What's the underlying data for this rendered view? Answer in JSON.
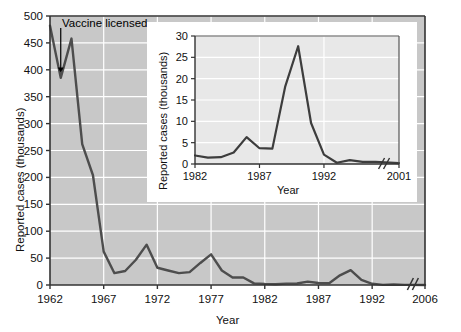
{
  "figure": {
    "background": "#ffffff",
    "plot_background": "#c8c8c8",
    "inset_plot_background": "#e8e8e8",
    "gridline_color": "#ffffff",
    "line_color": "#4d4d4d",
    "axis_color": "#333333"
  },
  "chart_data": [
    {
      "id": "main",
      "type": "line",
      "title": "",
      "xlabel": "Year",
      "ylabel": "Reported cases (thousands)",
      "xlim": [
        1962,
        2006
      ],
      "ylim": [
        0,
        500
      ],
      "xticks": [
        1962,
        1967,
        1972,
        1977,
        1982,
        1987,
        1992,
        2006
      ],
      "xticklabels": [
        "1962",
        "1967",
        "1972",
        "1977",
        "1982",
        "1987",
        "1992",
        "2006"
      ],
      "yticks": [
        0,
        50,
        100,
        150,
        200,
        250,
        300,
        350,
        400,
        450,
        500
      ],
      "yticklabels": [
        "0",
        "50",
        "100",
        "150",
        "200",
        "250",
        "300",
        "350",
        "400",
        "450",
        "500"
      ],
      "grid": true,
      "axis_break": {
        "axis": "x",
        "between": [
          1995,
          2006
        ],
        "symbol": "//"
      },
      "annotations": [
        {
          "text": "Vaccine licensed",
          "x": 1963,
          "y": 395,
          "arrow": true
        }
      ],
      "x": [
        1962,
        1963,
        1964,
        1965,
        1966,
        1967,
        1968,
        1969,
        1970,
        1971,
        1972,
        1973,
        1974,
        1975,
        1976,
        1977,
        1978,
        1979,
        1980,
        1981,
        1982,
        1983,
        1984,
        1985,
        1986,
        1987,
        1988,
        1989,
        1990,
        1991,
        1992,
        1993,
        1994,
        1995,
        2006
      ],
      "values": [
        482,
        385,
        458,
        262,
        204,
        62,
        22,
        26,
        47,
        75,
        32,
        27,
        22,
        24,
        41,
        57,
        27,
        14,
        14,
        3,
        2,
        1.5,
        2.6,
        2.8,
        6.3,
        3.7,
        3.4,
        18,
        27.7,
        9.6,
        2.2,
        0.3,
        1,
        0.3,
        0.1
      ]
    },
    {
      "id": "inset",
      "type": "line",
      "title": "",
      "xlabel": "Year",
      "ylabel": "Reported cases (thousands)",
      "xlim": [
        1982,
        2001
      ],
      "ylim": [
        0,
        30
      ],
      "xticks": [
        1982,
        1987,
        1992,
        2001
      ],
      "xticklabels": [
        "1982",
        "1987",
        "1992",
        "2001"
      ],
      "yticks": [
        0,
        5,
        10,
        15,
        20,
        25,
        30
      ],
      "yticklabels": [
        "0",
        "5",
        "10",
        "15",
        "20",
        "25",
        "30"
      ],
      "grid": true,
      "axis_break": {
        "axis": "x",
        "between": [
          1996,
          2001
        ],
        "symbol": "//"
      },
      "x": [
        1982,
        1983,
        1984,
        1985,
        1986,
        1987,
        1988,
        1989,
        1990,
        1991,
        1992,
        1993,
        1994,
        1995,
        1996,
        2001
      ],
      "values": [
        2.0,
        1.5,
        1.6,
        2.7,
        6.3,
        3.7,
        3.6,
        18.2,
        27.6,
        9.6,
        2.2,
        0.3,
        0.9,
        0.5,
        0.5,
        0.2
      ]
    }
  ]
}
